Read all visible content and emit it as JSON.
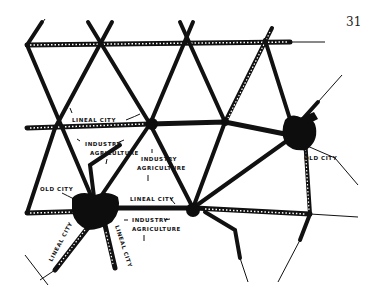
{
  "page_number": "31",
  "figure": {
    "labels": {
      "lineal_city_1": "LINEAL CITY",
      "lineal_city_2": "LINEAL CITY",
      "lineal_city_3": "LINEAL CITY",
      "lineal_city_4": "LINEAL CITY",
      "industry_1": "INDUSTRY",
      "agriculture_1": "AGRICULTURE",
      "industry_2": "INDUSTRY",
      "agriculture_2": "AGRICULTURE",
      "industry_3": "INDUSTRY",
      "agriculture_3": "AGRICULTURE",
      "old_city_left": "OLD CITY",
      "old_city_right": "OLD CITY"
    },
    "colors": {
      "ink": "#111111",
      "paper": "#ffffff"
    }
  }
}
